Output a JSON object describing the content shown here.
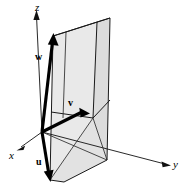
{
  "figure": {
    "background_color": "#ffffff",
    "edge_color": "#1a1a1a",
    "vector_color": "#000000",
    "face_color_light": "#e8e8e8",
    "face_color_mid": "#dedede",
    "face_color_dark": "#d2d2d2"
  },
  "axes": [
    {
      "key": "x",
      "label": "x",
      "style": "italic",
      "x": 11,
      "y": 151
    },
    {
      "key": "y",
      "label": "y",
      "style": "italic",
      "x": 173,
      "y": 160
    },
    {
      "key": "z",
      "label": "z",
      "style": "italic",
      "x": 35,
      "y": 2
    }
  ],
  "vectors": [
    {
      "key": "u",
      "label": "u",
      "style": "bold",
      "x": 36,
      "y": 157
    },
    {
      "key": "v",
      "label": "v",
      "style": "bold",
      "x": 68,
      "y": 98
    },
    {
      "key": "w",
      "label": "w",
      "style": "bold",
      "x": 36,
      "y": 52
    }
  ],
  "geometry": {
    "origin": {
      "x": 42,
      "y": 132
    },
    "z_axis_tip": {
      "x": 36,
      "y": 12
    },
    "x_axis_tip": {
      "x": 16,
      "y": 150
    },
    "y_axis_tip": {
      "x": 170,
      "y": 165
    },
    "u_tip": {
      "x": 50,
      "y": 180
    },
    "v_tip": {
      "x": 88,
      "y": 114
    },
    "w_tip": {
      "x": 53,
      "y": 36
    }
  }
}
